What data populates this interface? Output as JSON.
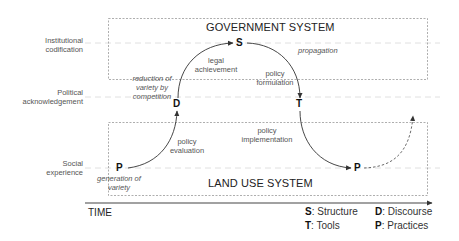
{
  "levels": [
    {
      "id": "institutional",
      "label_line1": "Institutional",
      "label_line2": "codification"
    },
    {
      "id": "political",
      "label_line1": "Political",
      "label_line2": "acknowledgement"
    },
    {
      "id": "social",
      "label_line1": "Social",
      "label_line2": "experience"
    }
  ],
  "systems": {
    "government": "GOVERNMENT SYSTEM",
    "land_use": "LAND USE SYSTEM"
  },
  "nodes": {
    "p_start": "P",
    "d": "D",
    "s": "S",
    "t": "T",
    "p_end": "P"
  },
  "transitions": {
    "policy_evaluation": {
      "line1": "policy",
      "line2": "evaluation"
    },
    "legal_achievement": {
      "line1": "legal",
      "line2": "achievement"
    },
    "policy_formulation": {
      "line1": "policy",
      "line2": "formulation"
    },
    "policy_implementation": {
      "line1": "policy",
      "line2": "implementation"
    }
  },
  "annotations": {
    "generation_of_variety": {
      "line1": "generation of",
      "line2": "variety"
    },
    "reduction_of_variety": {
      "line1": "reduction of",
      "line2": "variety by",
      "line3": "competition"
    },
    "propagation": "propagation"
  },
  "axis": {
    "label": "TIME"
  },
  "legend": [
    {
      "key": "S",
      "text": ": Structure"
    },
    {
      "key": "D",
      "text": ": Discourse"
    },
    {
      "key": "T",
      "text": ": Tools"
    },
    {
      "key": "P",
      "text": ": Practices"
    }
  ]
}
